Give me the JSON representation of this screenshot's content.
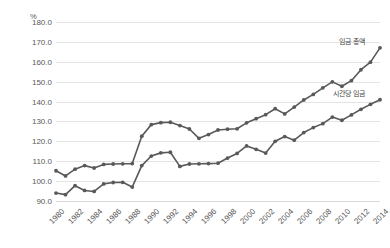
{
  "axis": {
    "unit_label": "%",
    "y_ticks": [
      "180.0",
      "170.0",
      "160.0",
      "150.0",
      "140.0",
      "130.0",
      "120.0",
      "110.0",
      "100.0",
      "90.0"
    ],
    "x_ticks": [
      "1980",
      "1982",
      "1984",
      "1986",
      "1988",
      "1990",
      "1992",
      "1994",
      "1996",
      "1998",
      "2000",
      "2002",
      "2004",
      "2006",
      "2008",
      "2010",
      "2012",
      "2014"
    ]
  },
  "labels": {
    "total_wage": "임금 총액",
    "hourly_wage": "시간당 임금"
  },
  "colors": {
    "series": "#595959",
    "gridline": "#e4e4e4",
    "baseline": "#d9d9d9",
    "text": "#595959",
    "background": "#ffffff"
  },
  "chart_data": {
    "type": "line",
    "title": "",
    "xlabel": "",
    "ylabel": "%",
    "ylim": [
      90,
      180
    ],
    "xlim": [
      1980,
      2014
    ],
    "grid": true,
    "legend_position": "inline-right",
    "x": [
      1980,
      1981,
      1982,
      1983,
      1984,
      1985,
      1986,
      1987,
      1988,
      1989,
      1990,
      1991,
      1992,
      1993,
      1994,
      1995,
      1996,
      1997,
      1998,
      1999,
      2000,
      2001,
      2002,
      2003,
      2004,
      2005,
      2006,
      2007,
      2008,
      2009,
      2010,
      2011,
      2012,
      2013,
      2014
    ],
    "series": [
      {
        "name": "임금 총액",
        "values": [
          105.2,
          102.6,
          106.0,
          107.8,
          106.6,
          108.4,
          108.6,
          108.7,
          108.8,
          122.6,
          128.4,
          129.4,
          129.6,
          127.9,
          126.2,
          121.5,
          123.4,
          125.7,
          126.1,
          126.3,
          129.3,
          131.4,
          133.4,
          136.4,
          133.8,
          137.2,
          140.8,
          143.6,
          146.9,
          149.9,
          147.7,
          150.5,
          156.0,
          159.8,
          167.0
        ]
      },
      {
        "name": "시간당 임금",
        "values": [
          94.0,
          93.2,
          97.7,
          95.3,
          94.8,
          98.6,
          99.3,
          99.4,
          97.0,
          107.8,
          112.6,
          114.2,
          114.5,
          107.4,
          108.6,
          108.7,
          108.8,
          109.0,
          111.6,
          113.9,
          117.7,
          116.0,
          114.1,
          120.0,
          122.4,
          120.6,
          124.4,
          126.9,
          128.9,
          132.2,
          130.6,
          133.3,
          136.1,
          138.6,
          140.9
        ]
      }
    ]
  }
}
